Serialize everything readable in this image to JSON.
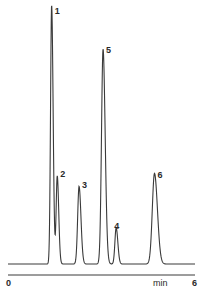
{
  "chart_data": {
    "type": "line",
    "subtype": "chromatogram",
    "title": "",
    "xlabel": "min",
    "ylabel": "",
    "xlim": [
      0,
      6
    ],
    "x_ticks": [
      "0",
      "6"
    ],
    "grid": false,
    "legend": null,
    "baseline_level": 0.0,
    "peaks": [
      {
        "label": "1",
        "retention_time_min": 1.4,
        "relative_height": 1.0
      },
      {
        "label": "2",
        "retention_time_min": 1.58,
        "relative_height": 0.34
      },
      {
        "label": "3",
        "retention_time_min": 2.28,
        "relative_height": 0.3
      },
      {
        "label": "5",
        "retention_time_min": 3.05,
        "relative_height": 0.83
      },
      {
        "label": "4",
        "retention_time_min": 3.47,
        "relative_height": 0.14
      },
      {
        "label": "6",
        "retention_time_min": 4.7,
        "relative_height": 0.35
      }
    ]
  },
  "axis": {
    "start_label": "0",
    "unit_label": "min",
    "end_label": "6"
  },
  "style": {
    "line_color": "#3a3a3a",
    "text_color": "#2a2a2a",
    "background": "#ffffff"
  }
}
